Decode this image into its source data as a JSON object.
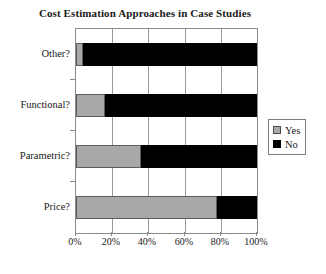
{
  "chart_data": {
    "type": "bar",
    "orientation": "horizontal",
    "stacked": true,
    "normalized": true,
    "title": "Cost Estimation Approaches in Case Studies",
    "xlabel": "",
    "ylabel": "",
    "categories": [
      "Other?",
      "Functional?",
      "Parametric?",
      "Price?"
    ],
    "series": [
      {
        "name": "Yes",
        "color": "#a8a8a8",
        "values": [
          4,
          16,
          36,
          78
        ]
      },
      {
        "name": "No",
        "color": "#000000",
        "values": [
          96,
          84,
          64,
          22
        ]
      }
    ],
    "xlim": [
      0,
      100
    ],
    "xticks": [
      0,
      20,
      40,
      60,
      80,
      100
    ],
    "xticklabels": [
      "0%",
      "20%",
      "40%",
      "60%",
      "80%",
      "100%"
    ],
    "grid": "vertical",
    "legend_position": "right",
    "legend_entries": [
      "Yes",
      "No"
    ]
  }
}
